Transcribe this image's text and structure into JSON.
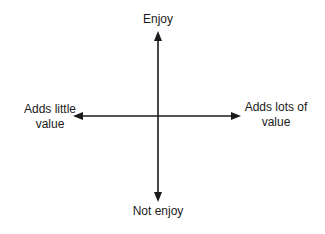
{
  "diagram": {
    "type": "quadrant-axes",
    "vertical_axis": {
      "top_label": "Enjoy",
      "bottom_label": "Not enjoy"
    },
    "horizontal_axis": {
      "left_label_line1": "Adds little",
      "left_label_line2": "value",
      "right_label_line1": "Adds lots of",
      "right_label_line2": "value"
    },
    "colors": {
      "line": "#1a1a1a",
      "background": "#ffffff"
    }
  }
}
